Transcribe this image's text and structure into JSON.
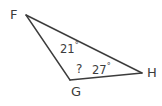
{
  "figure": {
    "type": "triangle-diagram",
    "background_color": "#ffffff",
    "stroke_color": "#3c3c3c",
    "text_color": "#3c3c3c",
    "width": 162,
    "height": 106
  },
  "vertices": [
    {
      "id": "F",
      "label": "F",
      "x": 26,
      "y": 15
    },
    {
      "id": "G",
      "label": "G",
      "x": 70,
      "y": 80
    },
    {
      "id": "H",
      "label": "H",
      "x": 142,
      "y": 73
    }
  ],
  "edges": [
    {
      "id": "FG",
      "from": "F",
      "to": "G"
    },
    {
      "id": "GH",
      "from": "G",
      "to": "H"
    },
    {
      "id": "FH",
      "from": "F",
      "to": "H"
    }
  ],
  "angles": [
    {
      "at": "F",
      "value": "21",
      "degree_symbol": "°",
      "text": "21°",
      "known": true
    },
    {
      "at": "G",
      "value": "?",
      "degree_symbol": "",
      "text": "?",
      "known": false
    },
    {
      "at": "H",
      "value": "27",
      "degree_symbol": "°",
      "text": "27°",
      "known": true
    }
  ],
  "labels": {
    "vertex_F": "F",
    "vertex_G": "G",
    "vertex_H": "H",
    "angle_F_value": "21",
    "angle_F_degree": "°",
    "angle_H_value": "27",
    "angle_H_degree": "°",
    "angle_G_unknown": "?"
  }
}
